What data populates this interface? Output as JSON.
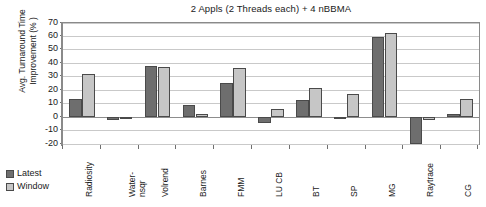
{
  "chart_data": {
    "type": "bar",
    "title": "2 Appls (2 Threads each) + 4 nBBMA",
    "xlabel": "",
    "ylabel": "Avg. Turnaround Time Improvement (% )",
    "ylim": [
      -20,
      70
    ],
    "ytick_step": 10,
    "yticks": [
      70,
      60,
      50,
      40,
      30,
      20,
      10,
      0,
      -10,
      -20
    ],
    "ytick_labels": [
      "70",
      "60",
      "50",
      "40",
      "30",
      "20",
      "10",
      "0",
      "-10",
      "-20"
    ],
    "grid": true,
    "legend_position": "bottom-left",
    "categories": [
      "Radiosity",
      "Water-nsqr",
      "Volrend",
      "Barnes",
      "FMM",
      "LU CB",
      "BT",
      "SP",
      "MG",
      "Raytrace",
      "CG"
    ],
    "category_labels": [
      "Radiosity",
      "Water-\nnsqr",
      "Volrend",
      "Barnes",
      "FMM",
      "LU CB",
      "BT",
      "SP",
      "MG",
      "Raytrace",
      "CG"
    ],
    "series": [
      {
        "name": "Latest",
        "color": "#6e6e6e",
        "values": [
          13.2,
          -2.5,
          38.2,
          8.7,
          25.1,
          -4.3,
          12.8,
          -1.0,
          59.3,
          -20.3,
          2.4
        ]
      },
      {
        "name": "Window",
        "color": "#c6c6c6",
        "values": [
          32.3,
          -0.6,
          37.4,
          2.1,
          36.4,
          6.1,
          21.3,
          16.9,
          62.3,
          -2.0,
          13.7
        ]
      }
    ]
  },
  "legend": {
    "items": [
      {
        "label": "Latest",
        "color": "#6e6e6e"
      },
      {
        "label": "Window",
        "color": "#c6c6c6"
      }
    ]
  }
}
